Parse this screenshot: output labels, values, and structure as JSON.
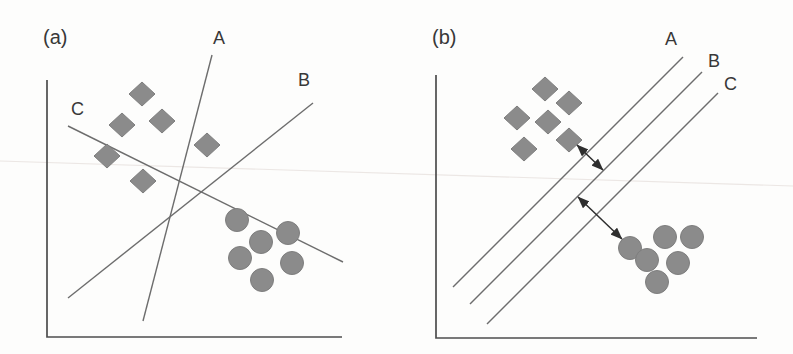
{
  "figure": {
    "background": "#fdfdfc",
    "colors": {
      "marker_fill": "#8b8b8b",
      "marker_edge": "#7e7e7e",
      "separator_line": "#6d6d6d",
      "axis": "#4d4d4d",
      "label_text": "#383838",
      "arrow": "#2e2e2e",
      "scan_artifact": "#e8e2df"
    },
    "scan_artifact_line": {
      "x1": 0,
      "y1": 161,
      "x2": 793,
      "y2": 186
    },
    "panels": [
      {
        "id": "a",
        "label": "(a)",
        "label_pos": {
          "x": 43,
          "y": 44
        },
        "axis": {
          "y_top": [
            47,
            80
          ],
          "origin": [
            47,
            337
          ],
          "x_end": [
            342,
            337
          ]
        },
        "lines": [
          {
            "label": "A",
            "x1": 212,
            "y1": 55,
            "x2": 143,
            "y2": 321,
            "label_pos": [
              213,
              44
            ]
          },
          {
            "label": "B",
            "x1": 68,
            "y1": 298,
            "x2": 313,
            "y2": 103,
            "label_pos": [
              298,
              86
            ]
          },
          {
            "label": "C",
            "x1": 68,
            "y1": 126,
            "x2": 343,
            "y2": 262,
            "label_pos": [
              71,
              115
            ]
          }
        ],
        "diamonds": [
          [
            142,
            94
          ],
          [
            122,
            125
          ],
          [
            162,
            121
          ],
          [
            107,
            156
          ],
          [
            143,
            181
          ],
          [
            207,
            145
          ]
        ],
        "circles": [
          [
            237,
            220
          ],
          [
            261,
            242
          ],
          [
            288,
            233
          ],
          [
            240,
            258
          ],
          [
            292,
            263
          ],
          [
            262,
            280
          ]
        ],
        "arrows": []
      },
      {
        "id": "b",
        "label": "(b)",
        "label_pos": {
          "x": 432,
          "y": 44
        },
        "axis": {
          "y_top": [
            436,
            75
          ],
          "origin": [
            436,
            338
          ],
          "x_end": [
            757,
            338
          ]
        },
        "lines": [
          {
            "label": "A",
            "x1": 453,
            "y1": 287,
            "x2": 683,
            "y2": 57,
            "label_pos": [
              665,
              45
            ]
          },
          {
            "label": "B",
            "x1": 470,
            "y1": 304,
            "x2": 702,
            "y2": 72,
            "label_pos": [
              708,
              67
            ]
          },
          {
            "label": "C",
            "x1": 487,
            "y1": 324,
            "x2": 718,
            "y2": 93,
            "label_pos": [
              724,
              90
            ]
          }
        ],
        "diamonds": [
          [
            545,
            89
          ],
          [
            569,
            103
          ],
          [
            517,
            118
          ],
          [
            548,
            122
          ],
          [
            569,
            140
          ],
          [
            524,
            149
          ]
        ],
        "circles": [
          [
            630,
            248
          ],
          [
            647,
            260
          ],
          [
            665,
            237
          ],
          [
            692,
            237
          ],
          [
            678,
            263
          ],
          [
            657,
            282
          ]
        ],
        "arrows": [
          {
            "x1": 577,
            "y1": 145,
            "x2": 603,
            "y2": 170
          },
          {
            "x1": 578,
            "y1": 197,
            "x2": 622,
            "y2": 239
          }
        ]
      }
    ],
    "marker_geometry": {
      "diamond_half_w": 13,
      "diamond_half_h": 12,
      "circle_radius": 11.5
    }
  }
}
